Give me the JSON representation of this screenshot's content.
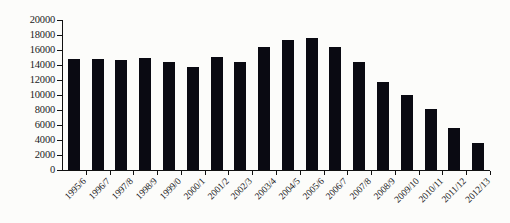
{
  "chart_data": {
    "type": "bar",
    "title": "",
    "subtitle": "",
    "xlabel": "",
    "ylabel": "",
    "ylim": [
      0,
      20000
    ],
    "ytick_step": 2000,
    "ytick_labels": [
      "0",
      "2000",
      "4000",
      "6000",
      "8000",
      "10000",
      "12000",
      "14000",
      "16000",
      "18000",
      "20000"
    ],
    "grid": false,
    "legend": false,
    "legend_position": "none",
    "bar_color": "#0a0a12",
    "background_color": "#fcfcfa",
    "axis_color": "#111111",
    "categories": [
      "1995/6",
      "1996/7",
      "1997/8",
      "1998/9",
      "1999/0",
      "2000/1",
      "2001/2",
      "2002/3",
      "2003/4",
      "2004/5",
      "2005/6",
      "2006/7",
      "2007/8",
      "2008/9",
      "2009/10",
      "2010/11",
      "2011/12",
      "2012/13"
    ],
    "values": [
      14800,
      14850,
      14650,
      14900,
      14400,
      13700,
      15050,
      14350,
      16400,
      17400,
      17550,
      16400,
      14450,
      11800,
      10000,
      8100,
      5650,
      3650
    ]
  }
}
